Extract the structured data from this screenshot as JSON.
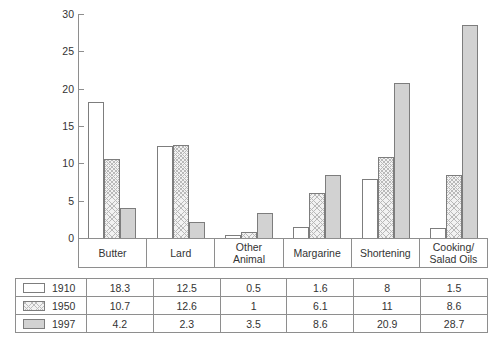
{
  "chart_data": {
    "type": "bar",
    "title": "",
    "xlabel": "",
    "ylabel": "",
    "ylim": [
      0,
      30
    ],
    "yticks": [
      0,
      5,
      10,
      15,
      20,
      25,
      30
    ],
    "ytick_labels": [
      "0",
      "5",
      "10",
      "15",
      "20",
      "25",
      "30"
    ],
    "grid": false,
    "legend_position": "table-below",
    "categories": [
      "Butter",
      "Lard",
      "Other Animal",
      "Margarine",
      "Shortening",
      "Cooking/ Salad Oils"
    ],
    "category_lines": [
      [
        "Butter"
      ],
      [
        "Lard"
      ],
      [
        "Other",
        "Animal"
      ],
      [
        "Margarine"
      ],
      [
        "Shortening"
      ],
      [
        "Cooking/",
        "Salad Oils"
      ]
    ],
    "series": [
      {
        "name": "1910",
        "fill": "white",
        "color": "#ffffff",
        "values": [
          18.3,
          12.5,
          0.5,
          1.6,
          8,
          1.5
        ],
        "labels": [
          "18.3",
          "12.5",
          "0.5",
          "1.6",
          "8",
          "1.5"
        ]
      },
      {
        "name": "1950",
        "fill": "crosshatch",
        "color": "#f2f2f2",
        "values": [
          10.7,
          12.6,
          1,
          6.1,
          11,
          8.6
        ],
        "labels": [
          "10.7",
          "12.6",
          "1",
          "6.1",
          "11",
          "8.6"
        ]
      },
      {
        "name": "1997",
        "fill": "solid-gray",
        "color": "#d2d2d2",
        "values": [
          4.2,
          2.3,
          3.5,
          8.6,
          20.9,
          28.7
        ],
        "labels": [
          "4.2",
          "2.3",
          "3.5",
          "8.6",
          "20.9",
          "28.7"
        ]
      }
    ]
  },
  "table": {
    "row_headers": [
      "1910",
      "1950",
      "1997"
    ],
    "rows": [
      [
        "18.3",
        "12.5",
        "0.5",
        "1.6",
        "8",
        "1.5"
      ],
      [
        "10.7",
        "12.6",
        "1",
        "6.1",
        "11",
        "8.6"
      ],
      [
        "4.2",
        "2.3",
        "3.5",
        "8.6",
        "20.9",
        "28.7"
      ]
    ]
  },
  "style": {
    "axis_color": "#8e8e8e",
    "bar_border": "#7d7d7d",
    "text_color": "#333333"
  }
}
